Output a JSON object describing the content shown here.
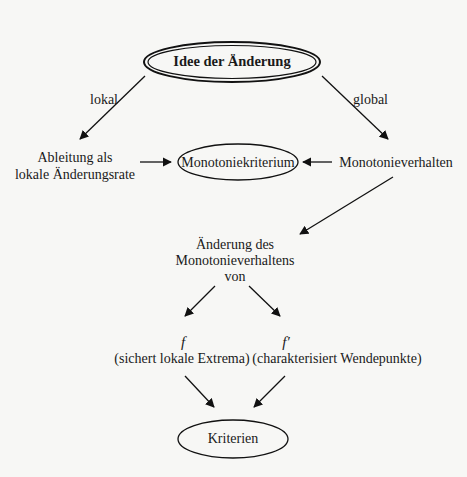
{
  "diagram": {
    "title": "Idee der Änderung",
    "edge_labels": {
      "local": "lokal",
      "global": "global"
    },
    "nodes": {
      "derivative": [
        "Ableitung als",
        "lokale Änderungsrate"
      ],
      "monotony_criterion": "Monotoniekriterium",
      "monotony_behavior": "Monotonieverhalten",
      "change_monotony": [
        "Änderung des",
        "Monotonieverhaltens",
        "von"
      ],
      "f_symbol": "f",
      "f_prime_symbol": "f′",
      "f_desc": "(sichert lokale Extrema)",
      "f_prime_desc": "(charakterisiert Wendepunkte)",
      "criteria": "Kriterien"
    },
    "edges": [
      {
        "from": "Idee der Änderung",
        "to": "Ableitung als lokale Änderungsrate",
        "label": "lokal"
      },
      {
        "from": "Idee der Änderung",
        "to": "Monotonieverhalten",
        "label": "global"
      },
      {
        "from": "Ableitung als lokale Änderungsrate",
        "to": "Monotoniekriterium"
      },
      {
        "from": "Monotonieverhalten",
        "to": "Monotoniekriterium"
      },
      {
        "from": "Monotonieverhalten",
        "to": "Änderung des Monotonieverhaltens von"
      },
      {
        "from": "Änderung des Monotonieverhaltens von",
        "to": "f"
      },
      {
        "from": "Änderung des Monotonieverhaltens von",
        "to": "f′"
      },
      {
        "from": "f",
        "to": "Kriterien"
      },
      {
        "from": "f′",
        "to": "Kriterien"
      }
    ]
  }
}
